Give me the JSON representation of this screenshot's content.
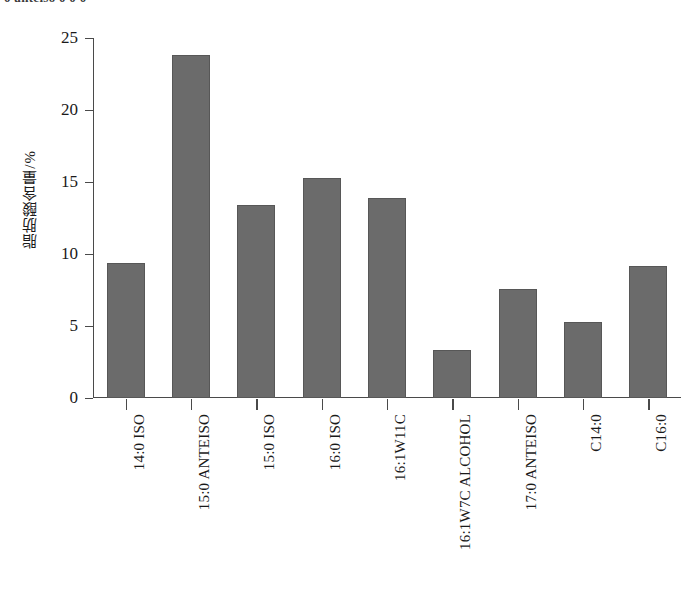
{
  "top_cropped_line": {
    "text": "0 anteiso 0 0 0"
  },
  "chart_data": {
    "type": "bar",
    "title": "",
    "subtitle": "",
    "xlabel": "",
    "ylabel": "脂肪酸含量/%",
    "ylim": [
      0,
      25
    ],
    "yticks": [
      0,
      5,
      10,
      15,
      20,
      25
    ],
    "ytick_labels": [
      "0",
      "5",
      "10",
      "15",
      "20",
      "25"
    ],
    "grid": false,
    "legend": null,
    "bar_color": "#6b6b6b",
    "bar_edge_color": "#575757",
    "axis_color": "#4a4a4a",
    "categories": [
      "14:0 ISO",
      "15:0 ANTEISO",
      "15:0 ISO",
      "16:0 ISO",
      "16:1W11C",
      "16:1W7C ALCOHOL",
      "17:0 ANTEISO",
      "C14:0",
      "C16:0"
    ],
    "values": [
      9.4,
      23.8,
      13.4,
      15.3,
      13.9,
      3.3,
      7.6,
      5.3,
      9.2
    ]
  }
}
